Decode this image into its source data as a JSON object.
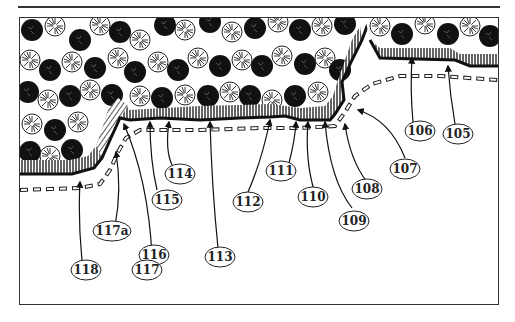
{
  "figure": {
    "type": "landscape edge planting diagram",
    "colors": {
      "ink": "#222222",
      "paper": "#ffffff",
      "frame": "#333333"
    }
  },
  "callouts": [
    {
      "id": "105",
      "label": "105"
    },
    {
      "id": "106",
      "label": "106"
    },
    {
      "id": "107",
      "label": "107"
    },
    {
      "id": "108",
      "label": "108"
    },
    {
      "id": "109",
      "label": "109"
    },
    {
      "id": "110",
      "label": "110"
    },
    {
      "id": "111",
      "label": "111"
    },
    {
      "id": "112",
      "label": "112"
    },
    {
      "id": "113",
      "label": "113"
    },
    {
      "id": "114",
      "label": "114"
    },
    {
      "id": "115",
      "label": "115"
    },
    {
      "id": "116",
      "label": "116"
    },
    {
      "id": "117",
      "label": "117"
    },
    {
      "id": "117a",
      "label": "117a"
    },
    {
      "id": "118",
      "label": "118"
    }
  ]
}
